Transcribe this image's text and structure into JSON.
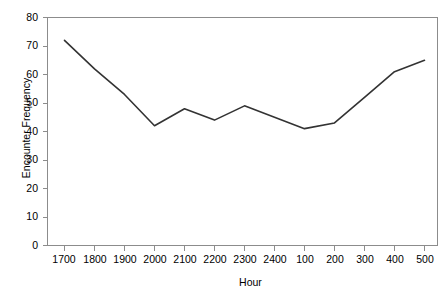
{
  "chart_data": {
    "type": "line",
    "title": "",
    "xlabel": "Hour",
    "ylabel": "Encounter Frequency",
    "categories": [
      "1700",
      "1800",
      "1900",
      "2000",
      "2100",
      "2200",
      "2300",
      "2400",
      "100",
      "200",
      "300",
      "400",
      "500"
    ],
    "values": [
      72,
      62,
      53,
      42,
      48,
      44,
      49,
      45,
      41,
      43,
      52,
      61,
      65
    ],
    "series": [
      {
        "name": "Encounter Frequency",
        "values": [
          72,
          62,
          53,
          42,
          48,
          44,
          49,
          45,
          41,
          43,
          52,
          61,
          65
        ]
      }
    ],
    "ylim": [
      0,
      80
    ],
    "yticks": [
      0,
      10,
      20,
      30,
      40,
      50,
      60,
      70,
      80
    ],
    "ytick_labels": [
      "0",
      "10",
      "20",
      "30",
      "40",
      "50",
      "60",
      "70",
      "80"
    ],
    "grid": false,
    "legend": "none",
    "line_color": "#333333",
    "axis_color": "#808080",
    "background_color": "#ffffff"
  },
  "axes": {
    "y_title": "Encounter Frequency",
    "x_title": "Hour"
  }
}
